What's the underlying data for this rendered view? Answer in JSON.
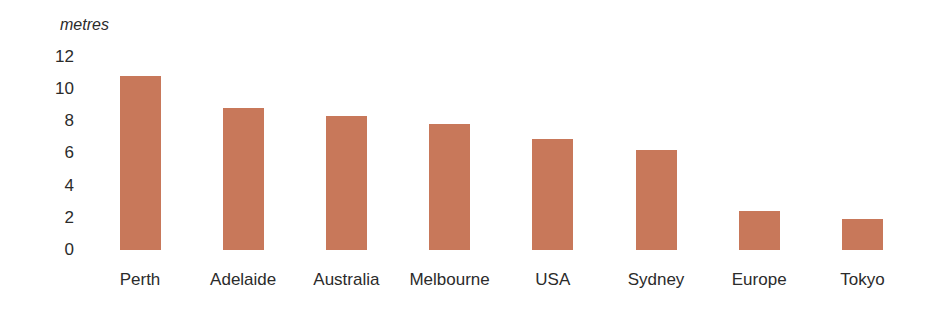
{
  "chart_data": {
    "type": "bar",
    "title": "",
    "xlabel": "",
    "ylabel": "metres",
    "ylim": [
      0,
      12
    ],
    "yticks": [
      0,
      2,
      4,
      6,
      8,
      10,
      12
    ],
    "grid": false,
    "legend": null,
    "bar_color": "#c8785a",
    "categories": [
      "Perth",
      "Adelaide",
      "Australia",
      "Melbourne",
      "USA",
      "Sydney",
      "Europe",
      "Tokyo"
    ],
    "values": [
      10.8,
      8.8,
      8.3,
      7.8,
      6.9,
      6.2,
      2.4,
      1.9
    ]
  }
}
